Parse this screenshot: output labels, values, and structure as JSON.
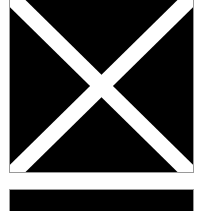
{
  "graphic": {
    "top_panel": {
      "shape": "square",
      "fill": "#000000",
      "border": "#9a9a9a",
      "mark": "diagonal-cross",
      "mark_color": "#ffffff"
    },
    "separator": {
      "fill": "#ffffff"
    },
    "bottom_panel": {
      "shape": "bar",
      "fill": "#000000",
      "border": "#9a9a9a"
    }
  }
}
